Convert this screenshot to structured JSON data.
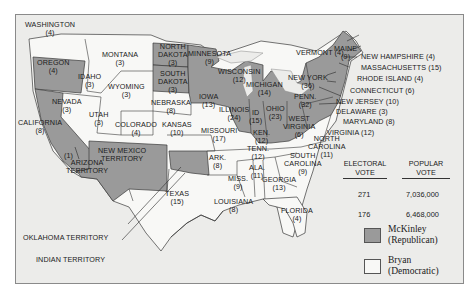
{
  "colors": {
    "republican": "#9a9a9a",
    "democratic": "#f8f8f6",
    "background": "#ececea",
    "border": "#3a3a3a"
  },
  "states": [
    {
      "id": "washington",
      "name": "WASHINGTON",
      "votes": "(4)",
      "party": "democratic"
    },
    {
      "id": "oregon",
      "name": "OREGON",
      "votes": "(4)",
      "party": "republican"
    },
    {
      "id": "california",
      "name": "CALIFORNIA",
      "votes": "(8)",
      "party": "republican"
    },
    {
      "id": "idaho",
      "name": "IDAHO",
      "votes": "(3)",
      "party": "democratic"
    },
    {
      "id": "nevada",
      "name": "NEVADA",
      "votes": "(3)",
      "party": "democratic"
    },
    {
      "id": "montana",
      "name": "MONTANA",
      "votes": "(3)",
      "party": "democratic"
    },
    {
      "id": "wyoming",
      "name": "WYOMING",
      "votes": "(3)",
      "party": "democratic"
    },
    {
      "id": "utah",
      "name": "UTAH",
      "votes": "(3)",
      "party": "democratic"
    },
    {
      "id": "colorado",
      "name": "COLORADO",
      "votes": "(4)",
      "party": "democratic"
    },
    {
      "id": "north-dakota",
      "name": "NORTH DAKOTA",
      "votes": "(3)",
      "party": "republican"
    },
    {
      "id": "south-dakota",
      "name": "SOUTH DAKOTA",
      "votes": "(3)",
      "party": "republican"
    },
    {
      "id": "nebraska",
      "name": "NEBRASKA",
      "votes": "(8)",
      "party": "democratic"
    },
    {
      "id": "kansas",
      "name": "KANSAS",
      "votes": "(10)",
      "party": "democratic"
    },
    {
      "id": "minnesota",
      "name": "MINNESOTA",
      "votes": "(9)",
      "party": "republican"
    },
    {
      "id": "iowa",
      "name": "IOWA",
      "votes": "(13)",
      "party": "republican"
    },
    {
      "id": "missouri",
      "name": "MISSOURI",
      "votes": "(17)",
      "party": "democratic"
    },
    {
      "id": "wisconsin",
      "name": "WISCONSIN",
      "votes": "(12)",
      "party": "republican"
    },
    {
      "id": "illinois",
      "name": "ILLINOIS",
      "votes": "(24)",
      "party": "republican"
    },
    {
      "id": "michigan",
      "name": "MICHIGAN",
      "votes": "(14)",
      "party": "republican"
    },
    {
      "id": "indiana",
      "name": "ID",
      "votes": "(15)",
      "party": "republican"
    },
    {
      "id": "ohio",
      "name": "OHIO",
      "votes": "(23)",
      "party": "republican"
    },
    {
      "id": "kentucky",
      "name": "KEN.",
      "votes": "(12)",
      "party": "republican"
    },
    {
      "id": "west-virginia",
      "name": "WEST VIRGINIA",
      "votes": "(6)",
      "party": "republican"
    },
    {
      "id": "pennsylvania",
      "name": "PENN.",
      "votes": "(32)",
      "party": "republican"
    },
    {
      "id": "new-york",
      "name": "NEW YORK",
      "votes": "(36)",
      "party": "republican"
    },
    {
      "id": "vermont",
      "name": "VERMONT",
      "votes": "(4)",
      "party": "republican"
    },
    {
      "id": "maine",
      "name": "MAINE",
      "votes": "(9)",
      "party": "republican"
    },
    {
      "id": "new-hampshire",
      "name": "NEW HAMPSHIRE",
      "votes": "(4)",
      "party": "republican"
    },
    {
      "id": "massachusetts",
      "name": "MASSACHUSETTS",
      "votes": "(15)",
      "party": "republican"
    },
    {
      "id": "rhode-island",
      "name": "RHODE ISLAND",
      "votes": "(4)",
      "party": "republican"
    },
    {
      "id": "connecticut",
      "name": "CONNECTICUT",
      "votes": "(6)",
      "party": "republican"
    },
    {
      "id": "new-jersey",
      "name": "NEW JERSEY",
      "votes": "(10)",
      "party": "republican"
    },
    {
      "id": "delaware",
      "name": "DELAWARE",
      "votes": "(3)",
      "party": "republican"
    },
    {
      "id": "maryland",
      "name": "MARYLAND",
      "votes": "(8)",
      "party": "republican"
    },
    {
      "id": "virginia",
      "name": "VIRGINIA",
      "votes": "(12)",
      "party": "democratic"
    },
    {
      "id": "north-carolina",
      "name": "NORTH CAROLINA",
      "votes": "(11)",
      "party": "democratic"
    },
    {
      "id": "south-carolina",
      "name": "SOUTH CAROLINA",
      "votes": "(9)",
      "party": "democratic"
    },
    {
      "id": "tennessee",
      "name": "TENN.",
      "votes": "(12)",
      "party": "democratic"
    },
    {
      "id": "arkansas",
      "name": "ARK.",
      "votes": "(8)",
      "party": "democratic"
    },
    {
      "id": "alabama",
      "name": "ALA.",
      "votes": "(11)",
      "party": "democratic"
    },
    {
      "id": "mississippi",
      "name": "MISS.",
      "votes": "(9)",
      "party": "democratic"
    },
    {
      "id": "georgia",
      "name": "GEORGIA",
      "votes": "(13)",
      "party": "democratic"
    },
    {
      "id": "louisiana",
      "name": "LOUISIANA",
      "votes": "(8)",
      "party": "democratic"
    },
    {
      "id": "florida",
      "name": "FLORIDA",
      "votes": "(4)",
      "party": "democratic"
    },
    {
      "id": "texas",
      "name": "TEXAS",
      "votes": "(15)",
      "party": "democratic"
    }
  ],
  "territories": [
    {
      "id": "new-mexico-territory",
      "name": "NEW MEXICO TERRITORY"
    },
    {
      "id": "arizona-territory",
      "name": "ARIZONA TERRITORY"
    },
    {
      "id": "oklahoma-territory",
      "name": "OKLAHOMA TERRITORY"
    },
    {
      "id": "indian-territory",
      "name": "INDIAN TERRITORY"
    }
  ],
  "split_marker": "(1)",
  "labels": {
    "washington": [
      "WASHINGTON",
      "(4)"
    ],
    "oregon": [
      "OREGON",
      "(4)"
    ],
    "california": [
      "CALIFORNIA",
      "(8)"
    ],
    "idaho": [
      "IDAHO",
      "(3)"
    ],
    "nevada": [
      "NEVADA",
      "(3)"
    ],
    "montana": [
      "MONTANA",
      "(3)"
    ],
    "wyoming": [
      "WYOMING",
      "(3)"
    ],
    "utah": [
      "UTAH",
      "(3)"
    ],
    "colorado": [
      "COLORADO",
      "(4)"
    ],
    "north_dakota": [
      "NORTH",
      "DAKOTA",
      "(3)"
    ],
    "south_dakota": [
      "SOUTH",
      "DAKOTA",
      "(3)"
    ],
    "nebraska": [
      "NEBRASKA",
      "(8)"
    ],
    "kansas": [
      "KANSAS",
      "(10)"
    ],
    "minnesota": [
      "MINNESOTA",
      "(9)"
    ],
    "iowa": [
      "IOWA",
      "(13)"
    ],
    "missouri": [
      "MISSOURI",
      "(17)"
    ],
    "wisconsin": [
      "WISCONSIN",
      "(12)"
    ],
    "illinois": [
      "ILLINOIS",
      "(24)"
    ],
    "michigan": [
      "MICHIGAN",
      "(14)"
    ],
    "indiana": [
      "ID",
      "(15)"
    ],
    "ohio": [
      "OHIO",
      "(23)"
    ],
    "kentucky": [
      "KEN.",
      "(12)"
    ],
    "west_virginia": [
      "WEST",
      "VIRGINIA",
      "(6)"
    ],
    "pennsylvania": [
      "PENN.",
      "(32)"
    ],
    "new_york": [
      "NEW YORK",
      "(36)"
    ],
    "vermont": "VERMONT (4)",
    "maine": [
      "MAINE",
      "(9)"
    ],
    "new_hampshire": "NEW HAMPSHIRE (4)",
    "massachusetts": "MASSACHUSETTS (15)",
    "rhode_island": "RHODE ISLAND (4)",
    "connecticut": "CONNECTICUT (6)",
    "new_jersey": "NEW JERSEY (10)",
    "delaware": "DELAWARE (3)",
    "maryland": "MARYLAND (8)",
    "virginia": "VIRGINIA (12)",
    "north_carolina": [
      "NORTH",
      "CAROLINA",
      "(11)"
    ],
    "south_carolina": [
      "SOUTH",
      "CAROLINA",
      "(9)"
    ],
    "tennessee": [
      "TENN.",
      "(12)"
    ],
    "arkansas": [
      "ARK.",
      "(8)"
    ],
    "alabama": [
      "ALA.",
      "(11)"
    ],
    "mississippi": [
      "MISS.",
      "(9)"
    ],
    "georgia": [
      "GEORGIA",
      "(13)"
    ],
    "louisiana": [
      "LOUISIANA",
      "(8)"
    ],
    "florida": [
      "FLORIDA",
      "(4)"
    ],
    "texas": [
      "TEXAS",
      "(15)"
    ],
    "new_mexico": [
      "NEW MEXICO",
      "TERRITORY"
    ],
    "arizona": [
      "ARIZONA",
      "TERRITORY"
    ],
    "oklahoma": "OKLAHOMA TERRITORY",
    "indian": "INDIAN TERRITORY",
    "split": "(1)"
  },
  "legend": {
    "headers": {
      "electoral": [
        "ELECTORAL",
        "VOTE"
      ],
      "popular": [
        "POPULAR",
        "VOTE"
      ]
    },
    "rows": [
      {
        "candidate": "McKinley",
        "party": "(Republican)",
        "electoral_vote": "271",
        "popular_vote": "7,036,000",
        "color": "#9a9a9a"
      },
      {
        "candidate": "Bryan",
        "party": "(Democratic)",
        "electoral_vote": "176",
        "popular_vote": "6,468,000",
        "color": "#f8f8f6"
      }
    ]
  }
}
